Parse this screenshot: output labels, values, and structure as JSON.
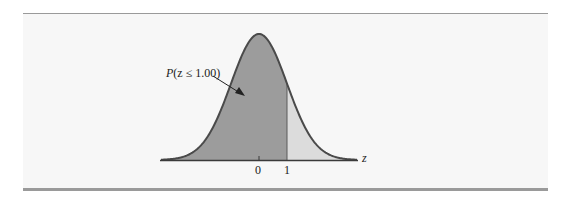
{
  "chart_data": {
    "type": "area",
    "title": "",
    "distribution": "standard normal",
    "xlabel": "z",
    "ylabel": "",
    "x_ticks": [
      0,
      1
    ],
    "x_tick_labels": [
      "0",
      "1"
    ],
    "xlim": [
      -3.5,
      3.5
    ],
    "shaded_regions": [
      {
        "name": "P(z ≤ 1.00)",
        "from": -3.5,
        "to": 1.0,
        "color": "#9c9c9c"
      },
      {
        "name": "P(z > 1.00)",
        "from": 1.0,
        "to": 3.5,
        "color": "#dcdcdc"
      }
    ],
    "annotations": [
      {
        "text": "P(z ≤ 1.00)",
        "points_to": "shaded area left of z = 1"
      }
    ],
    "grid": false,
    "legend": "none"
  },
  "labels": {
    "annotation_prefix": "P",
    "annotation_body": "(z ≤ 1.00)",
    "axis_var": "z",
    "tick0": "0",
    "tick1": "1"
  },
  "colors": {
    "left_fill": "#9c9c9c",
    "right_fill": "#dcdcdc",
    "curve": "#4a4a4a",
    "axis": "#3a3a3a",
    "rule": "#9a9a9a",
    "panel": "#f7f7f7"
  }
}
